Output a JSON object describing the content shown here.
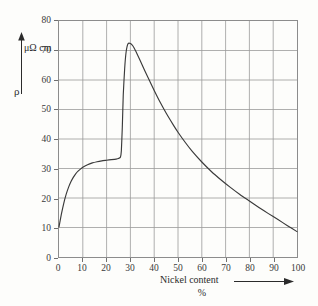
{
  "chart_data": {
    "type": "line",
    "title": "",
    "subtitle": "",
    "xlabel": "Nickel content",
    "xunit": "%",
    "ylabel": "ρ",
    "yunit": "μΩ cm",
    "xlim": [
      0,
      100
    ],
    "ylim": [
      0,
      80
    ],
    "xticks": [
      "0",
      "10",
      "20",
      "30",
      "40",
      "50",
      "60",
      "70",
      "80",
      "90",
      "100"
    ],
    "yticks": [
      "0",
      "10",
      "20",
      "30",
      "40",
      "50",
      "60",
      "70",
      "80"
    ],
    "xtick_values": [
      0,
      10,
      20,
      30,
      40,
      50,
      60,
      70,
      80,
      90,
      100
    ],
    "ytick_values": [
      0,
      10,
      20,
      30,
      40,
      50,
      60,
      70,
      80
    ],
    "grid": true,
    "legend": "none",
    "series": [
      {
        "name": "resistivity",
        "color": "#3a3a3a",
        "x": [
          0,
          1,
          2,
          3,
          4,
          5,
          6,
          7,
          8,
          9,
          10,
          12,
          14,
          16,
          18,
          20,
          22,
          24,
          25,
          25.8,
          26.2,
          26.6,
          27,
          27.6,
          28.2,
          29,
          30,
          31,
          32,
          34,
          36,
          38,
          40,
          42,
          45,
          48,
          50,
          53,
          56,
          60,
          64,
          68,
          72,
          76,
          80,
          84,
          88,
          92,
          96,
          100
        ],
        "y": [
          10.2,
          14.5,
          18.2,
          21.2,
          23.6,
          25.5,
          27.0,
          28.2,
          29.1,
          29.8,
          30.4,
          31.3,
          31.9,
          32.3,
          32.6,
          32.8,
          33.0,
          33.2,
          33.4,
          33.8,
          36.0,
          44.0,
          55.0,
          64.0,
          69.5,
          72.3,
          72.4,
          71.6,
          70.2,
          66.8,
          63.2,
          59.8,
          56.4,
          53.2,
          48.8,
          44.8,
          42.3,
          38.9,
          35.8,
          32.2,
          29.0,
          26.2,
          23.6,
          21.2,
          19.0,
          16.8,
          14.7,
          12.7,
          10.6,
          8.6
        ]
      }
    ],
    "annotations": {
      "plateau_value": 33,
      "peak_x": 29,
      "peak_y": 72.4,
      "start_y": 10.2,
      "end_y": 8.6
    },
    "colors": {
      "curve": "#3a3a3a",
      "grid": "#9a9a9a",
      "frame": "#6f6f6f",
      "text": "#2b2b2b",
      "background": "#fdfdfb"
    }
  }
}
